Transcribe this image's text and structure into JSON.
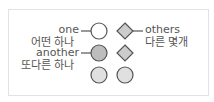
{
  "labels": {
    "one_en": "one",
    "one_ko": "어떤 하나",
    "another_en": "another",
    "another_ko": "또다른 하나",
    "others_en": "others",
    "others_ko": "다른 몇개"
  },
  "colors": {
    "stroke": "#555555",
    "white_fill": "#ffffff",
    "gray_fill": "#bdbdbd",
    "light_fill": "#e0e0e0",
    "diamond_fill": "#cccccc",
    "frame": "#e2e2e2"
  },
  "shapes": [
    {
      "type": "circle",
      "fill": "white",
      "row": 1,
      "col": 1
    },
    {
      "type": "diamond",
      "fill": "gray",
      "row": 1,
      "col": 2
    },
    {
      "type": "circle",
      "fill": "gray",
      "row": 2,
      "col": 1
    },
    {
      "type": "diamond",
      "fill": "gray",
      "row": 2,
      "col": 2
    },
    {
      "type": "circle",
      "fill": "light",
      "row": 3,
      "col": 1
    },
    {
      "type": "circle",
      "fill": "light",
      "row": 3,
      "col": 2
    }
  ]
}
